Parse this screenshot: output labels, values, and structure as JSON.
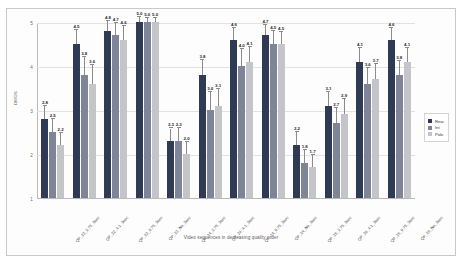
{
  "chart_data": {
    "type": "bar",
    "title": "",
    "xlabel": "Video sequences in decreasing quality order",
    "ylabel": "DMOS",
    "ylim": [
      1,
      5
    ],
    "yticks": [
      "1",
      "2",
      "3",
      "4",
      "5"
    ],
    "grid": true,
    "legend_position": "right",
    "categories": [
      "QP_22_2.75_3sec",
      "QP_22_4.1_3sec",
      "QP_22_9.75_3sec",
      "QP_22_No_3sec",
      "QP_24_2.75_3sec",
      "QP_24_4.1_3sec",
      "QP_24_9.75_3sec",
      "QP_24_No_3sec",
      "QP_26_2.75_3sec",
      "QP_26_4.1_3sec",
      "QP_26_9.75_3sec",
      "QP_26_No_3sec"
    ],
    "series": [
      {
        "name": "Rear",
        "color": "#2f3b55",
        "values": [
          2.8,
          4.5,
          4.8,
          5.0,
          2.3,
          3.8,
          4.6,
          4.7,
          2.2,
          3.1,
          4.1,
          4.6
        ],
        "errors": [
          0.3,
          0.32,
          0.22,
          0.12,
          0.28,
          0.34,
          0.26,
          0.24,
          0.3,
          0.32,
          0.3,
          0.26
        ]
      },
      {
        "name": "Int",
        "color": "#7d8596",
        "values": [
          2.5,
          3.8,
          4.7,
          5.0,
          2.3,
          3.0,
          4.0,
          4.5,
          1.8,
          2.7,
          3.6,
          3.8
        ],
        "errors": [
          0.3,
          0.4,
          0.28,
          0.1,
          0.3,
          0.4,
          0.38,
          0.3,
          0.3,
          0.34,
          0.36,
          0.32
        ]
      },
      {
        "name": "Pole",
        "color": "#c3c5c9",
        "values": [
          2.2,
          3.6,
          4.6,
          5.0,
          2.0,
          3.1,
          4.1,
          4.5,
          1.7,
          2.9,
          3.7,
          4.1
        ],
        "errors": [
          0.28,
          0.42,
          0.3,
          0.1,
          0.28,
          0.38,
          0.34,
          0.28,
          0.28,
          0.34,
          0.34,
          0.32
        ]
      }
    ]
  },
  "legend": {
    "items": [
      {
        "label": "Rear",
        "color": "#2f3b55"
      },
      {
        "label": "Int",
        "color": "#7d8596"
      },
      {
        "label": "Pole",
        "color": "#c3c5c9"
      }
    ]
  }
}
